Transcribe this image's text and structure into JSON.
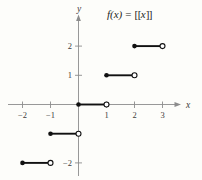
{
  "title": {
    "f": "f(x)",
    "equals": "=",
    "open_brackets": "[[",
    "arg": "x",
    "close_brackets": "]]"
  },
  "colors": {
    "background": "#fdfdfa",
    "axis": "#8c8c8c",
    "ink": "#111111",
    "label": "#3d3d3d",
    "open_point_fill": "#ffffff"
  },
  "chart_data": {
    "type": "line",
    "subtype": "step-function",
    "xlabel": "x",
    "ylabel": "y",
    "xlim": [
      -2.5,
      3.6
    ],
    "ylim": [
      -2.6,
      3.0
    ],
    "grid": false,
    "x_ticks": [
      -2,
      -1,
      1,
      2,
      3
    ],
    "x_tick_labels": [
      "−2",
      "−1",
      "1",
      "2",
      "3"
    ],
    "y_ticks": [
      2,
      1,
      -2
    ],
    "y_tick_labels": [
      "2",
      "1",
      "−2"
    ],
    "segments": [
      {
        "y": 2,
        "x_start": 2,
        "x_end": 3,
        "closed_at": "start"
      },
      {
        "y": 1,
        "x_start": 1,
        "x_end": 2,
        "closed_at": "start"
      },
      {
        "y": 0,
        "x_start": 0,
        "x_end": 1,
        "closed_at": "start"
      },
      {
        "y": -1,
        "x_start": -1,
        "x_end": 0,
        "closed_at": "start"
      },
      {
        "y": -2,
        "x_start": -2,
        "x_end": -1,
        "closed_at": "start"
      }
    ]
  }
}
